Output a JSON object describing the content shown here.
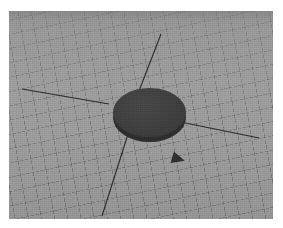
{
  "capture": {
    "width": 283,
    "height": 228,
    "clipped_header_text": "",
    "page_background": "#ffffff"
  },
  "viewport": {
    "name": "3d-viewport",
    "x": 9,
    "y": 11,
    "width": 264,
    "height": 208,
    "background_color": "#9a9a9a",
    "horizon_band_color": "#6f6f6f"
  },
  "grid": {
    "label": "perspective-ground-grid",
    "line_color": "#3c3c3c",
    "line_opacity": 0.32,
    "spacing_px": 13,
    "directions_deg": [
      80,
      168
    ],
    "fades_toward": "top"
  },
  "axes": {
    "label": "world-axis-lines",
    "color": "#2a2a2a",
    "width_px": 1,
    "lines": [
      {
        "name": "axis-line-left",
        "x1": 13,
        "y1": 78,
        "x2": 100,
        "y2": 93
      },
      {
        "name": "axis-line-right",
        "x1": 157,
        "y1": 108,
        "x2": 250,
        "y2": 127
      },
      {
        "name": "axis-line-up",
        "x1": 152,
        "y1": 23,
        "x2": 130,
        "y2": 80
      },
      {
        "name": "axis-line-down",
        "x1": 120,
        "y1": 120,
        "x2": 93,
        "y2": 205
      }
    ]
  },
  "object": {
    "name": "disc-cylinder",
    "shape": "cylinder",
    "top_face_color": "#3f3f3f",
    "side_wall_color": "#2d2d2d",
    "center_x": 140,
    "center_y": 101,
    "radius_x": 37,
    "radius_y": 25,
    "extrusion_px": 5
  },
  "cursor": {
    "name": "navigation-cursor",
    "glyph": "triangle-right",
    "color": "#2f2f2f",
    "x": 172,
    "y": 153,
    "width": 13,
    "height": 12,
    "rotation_deg": 16
  }
}
